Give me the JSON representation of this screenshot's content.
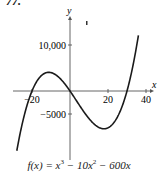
{
  "problem_number": "77.",
  "chart_data": {
    "type": "line",
    "title": "",
    "function": "f(x) = x^3 - 10x^2 - 600x",
    "xlabel": "x",
    "ylabel": "y",
    "x_ticks": [
      -20,
      20,
      40
    ],
    "x_tick_labels": [
      "-20",
      "20",
      "40"
    ],
    "y_ticks": [
      10000,
      -5000
    ],
    "y_tick_labels": [
      "10,000",
      "-5000"
    ],
    "xlim": [
      -30,
      40
    ],
    "ylim": [
      -13000,
      16000
    ],
    "grid": false,
    "series": [
      {
        "name": "f(x) = x^3 - 10x^2 - 600x",
        "x": [
          -28,
          -25,
          -20,
          -15,
          -11.6,
          -5,
          0,
          5,
          10,
          16.9,
          20,
          25,
          30,
          35,
          36
        ],
        "values": [
          -12992,
          -6875,
          0,
          3375,
          4053,
          2625,
          0,
          -3125,
          -6000,
          -8168,
          -8000,
          -5625,
          0,
          6125,
          7776
        ]
      }
    ],
    "key_points": {
      "roots": [
        -20,
        0,
        30
      ],
      "local_max": {
        "x": -11.6,
        "y": 4053
      },
      "local_min": {
        "x": 17.2,
        "y": -8169
      }
    }
  },
  "caption": {
    "prefix": "f(x) = x",
    "exp1": "3",
    "mid": " − 10x",
    "exp2": "2",
    "suffix": " − 600x"
  }
}
